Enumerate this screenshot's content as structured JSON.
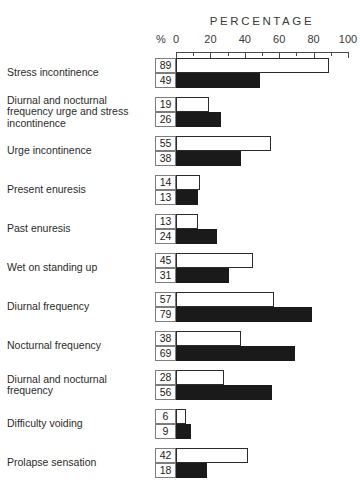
{
  "chart_data": {
    "type": "bar",
    "title": "PERCENTAGE",
    "xlabel": "PERCENTAGE",
    "ylabel": "",
    "unit_label": "%",
    "xlim": [
      0,
      100
    ],
    "grid": false,
    "orientation": "horizontal",
    "legend_position": "none",
    "ticks": [
      0,
      20,
      40,
      60,
      80,
      100
    ],
    "minor_ticks": [
      10,
      30,
      50,
      70,
      90
    ],
    "categories": [
      "Stress incontinence",
      "Diurnal and nocturnal frequency urge and stress incontinence",
      "Urge incontinence",
      "Present enuresis",
      "Past enuresis",
      "Wet on standing up",
      "Diurnal frequency",
      "Nocturnal frequency",
      "Diurnal and nocturnal frequency",
      "Difficulty voiding",
      "Prolapse sensation"
    ],
    "series": [
      {
        "name": "open",
        "style": "open-white-bar",
        "values": [
          89,
          19,
          55,
          14,
          13,
          45,
          57,
          38,
          28,
          6,
          42
        ]
      },
      {
        "name": "filled",
        "style": "solid-black-bar",
        "values": [
          49,
          26,
          38,
          13,
          24,
          31,
          79,
          69,
          56,
          9,
          18
        ]
      }
    ],
    "colors": {
      "open_bar_fill": "#ffffff",
      "open_bar_border": "#2b2b2b",
      "filled_bar": "#1a1a1a",
      "axis": "#4a4a4a",
      "text": "#2b2b2b",
      "box_border": "#7d7d7d",
      "background": "#ffffff"
    }
  }
}
